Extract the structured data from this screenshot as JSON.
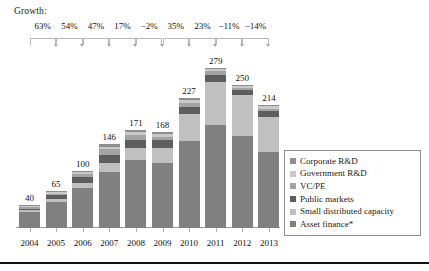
{
  "growth": {
    "title": "Growth:",
    "values": [
      "63%",
      "54%",
      "47%",
      "17%",
      "−2%",
      "35%",
      "23%",
      "−11%",
      "−14%"
    ]
  },
  "legend": {
    "items": [
      {
        "label": "Corporate R&D",
        "color": "#8e8e8e"
      },
      {
        "label": "Government R&D",
        "color": "#c9c9c9"
      },
      {
        "label": "VC/PE",
        "color": "#a3a3a3"
      },
      {
        "label": "Public markets",
        "color": "#5e5e5e"
      },
      {
        "label": "Small distributed capacity",
        "color": "#c0c0c0"
      },
      {
        "label": "Asset finance*",
        "color": "#808080"
      }
    ]
  },
  "chart_data": {
    "type": "bar",
    "stacked": true,
    "title": "",
    "xlabel": "",
    "ylabel": "",
    "grid": false,
    "legend_position": "right",
    "categories": [
      "2004",
      "2005",
      "2006",
      "2007",
      "2008",
      "2009",
      "2010",
      "2011",
      "2012",
      "2013"
    ],
    "totals": [
      40,
      65,
      100,
      146,
      171,
      168,
      227,
      279,
      250,
      214
    ],
    "total_labels": [
      "40",
      "65",
      "100",
      "146",
      "171",
      "168",
      "227",
      "279",
      "250",
      "214"
    ],
    "growth_labels": [
      "63%",
      "54%",
      "47%",
      "17%",
      "−2%",
      "35%",
      "23%",
      "−11%",
      "−14%"
    ],
    "series": [
      {
        "name": "Asset finance*",
        "color": "#808080",
        "values": [
          28,
          46,
          69,
          98,
          119,
          114,
          152,
          180,
          160,
          133
        ]
      },
      {
        "name": "Small distributed capacity",
        "color": "#c0c0c0",
        "values": [
          3,
          5,
          10,
          16,
          21,
          25,
          46,
          75,
          72,
          60
        ]
      },
      {
        "name": "Public markets",
        "color": "#5e5e5e",
        "values": [
          3,
          6,
          10,
          14,
          13,
          14,
          13,
          12,
          8,
          11
        ]
      },
      {
        "name": "VC/PE",
        "color": "#a3a3a3",
        "values": [
          2,
          3,
          5,
          9,
          9,
          6,
          7,
          7,
          5,
          4
        ]
      },
      {
        "name": "Government R&D",
        "color": "#c9c9c9",
        "values": [
          2,
          3,
          4,
          5,
          5,
          5,
          5,
          3,
          3,
          4
        ]
      },
      {
        "name": "Corporate R&D",
        "color": "#8e8e8e",
        "values": [
          2,
          2,
          2,
          4,
          4,
          4,
          4,
          2,
          2,
          2
        ]
      }
    ],
    "ylim": [
      0,
      300
    ]
  }
}
